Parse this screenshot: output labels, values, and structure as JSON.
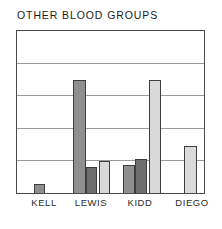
{
  "chart_data": {
    "type": "bar",
    "title": "OTHER BLOOD GROUPS",
    "xlabel": "",
    "ylabel": "",
    "ylim": [
      0,
      5
    ],
    "grid": true,
    "gridlines": [
      1,
      2,
      3,
      4
    ],
    "legend": "none",
    "legend_position": "none",
    "categories": [
      "KELL",
      "LEWIS",
      "KIDD",
      "DIEGO"
    ],
    "series": [
      {
        "name": "series-1",
        "color": "#8f8f8f",
        "values": [
          0.28,
          3.5,
          0.88,
          0
        ]
      },
      {
        "name": "series-2",
        "color": "#6e6e6e",
        "values": [
          0,
          0.8,
          1.05,
          0
        ]
      },
      {
        "name": "series-3",
        "color": "#d9d9d9",
        "values": [
          0,
          0.98,
          3.5,
          1.46
        ]
      }
    ],
    "bars": [
      {
        "category": "KELL",
        "series": "series-1",
        "value": 0.28,
        "color": "#8f8f8f",
        "x": 17,
        "w": 11
      },
      {
        "category": "LEWIS",
        "series": "series-1",
        "value": 3.5,
        "color": "#8f8f8f",
        "x": 56,
        "w": 13
      },
      {
        "category": "LEWIS",
        "series": "series-2",
        "value": 0.8,
        "color": "#6e6e6e",
        "x": 69,
        "w": 11
      },
      {
        "category": "LEWIS",
        "series": "series-3",
        "value": 0.98,
        "color": "#d9d9d9",
        "x": 82,
        "w": 11
      },
      {
        "category": "KIDD",
        "series": "series-1",
        "value": 0.88,
        "color": "#8f8f8f",
        "x": 106,
        "w": 12
      },
      {
        "category": "KIDD",
        "series": "series-2",
        "value": 1.05,
        "color": "#6e6e6e",
        "x": 118,
        "w": 12
      },
      {
        "category": "KIDD",
        "series": "series-3",
        "value": 3.5,
        "color": "#d9d9d9",
        "x": 132,
        "w": 12
      },
      {
        "category": "DIEGO",
        "series": "series-3",
        "value": 1.46,
        "color": "#d9d9d9",
        "x": 167,
        "w": 13
      }
    ],
    "category_label_x": [
      28,
      75,
      124,
      176
    ],
    "frame_color": "#4a4a4a",
    "grid_color": "#9a9a9a",
    "background": "#ffffff",
    "title_color": "#1b1b1b"
  }
}
